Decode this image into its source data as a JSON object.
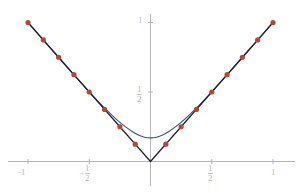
{
  "chart_data": {
    "type": "line",
    "title": "",
    "subtitle": "",
    "xlabel": "",
    "ylabel": "",
    "xlim": [
      -1.12,
      1.12
    ],
    "ylim": [
      -0.22,
      1.12
    ],
    "grid": false,
    "legend": null,
    "xticks": [
      -1,
      -0.5,
      0.5,
      1
    ],
    "xtick_labels": [
      "-1",
      "-1/2",
      "1/2",
      "1"
    ],
    "yticks": [
      0.5,
      1
    ],
    "ytick_labels": [
      "1/2",
      "1"
    ],
    "series": [
      {
        "name": "abs",
        "kind": "line",
        "color": "#1b1b2e",
        "width": 1.3,
        "x": [
          -1,
          -0.875,
          -0.75,
          -0.625,
          -0.5,
          -0.375,
          -0.25,
          -0.125,
          0,
          0.125,
          0.25,
          0.375,
          0.5,
          0.625,
          0.75,
          0.875,
          1
        ],
        "values": [
          1,
          0.875,
          0.75,
          0.625,
          0.5,
          0.375,
          0.25,
          0.125,
          0,
          0.125,
          0.25,
          0.375,
          0.5,
          0.625,
          0.75,
          0.875,
          1
        ]
      },
      {
        "name": "approximation",
        "kind": "line",
        "color": "#3b4f7d",
        "width": 1.1,
        "x": [
          -1,
          -0.9,
          -0.8,
          -0.7,
          -0.6,
          -0.5,
          -0.4,
          -0.3,
          -0.25,
          -0.2,
          -0.15,
          -0.1,
          -0.05,
          0,
          0.05,
          0.1,
          0.15,
          0.2,
          0.25,
          0.3,
          0.4,
          0.5,
          0.6,
          0.7,
          0.8,
          0.9,
          1
        ],
        "values": [
          1.0,
          0.898,
          0.797,
          0.697,
          0.598,
          0.501,
          0.407,
          0.321,
          0.282,
          0.247,
          0.216,
          0.191,
          0.175,
          0.17,
          0.175,
          0.191,
          0.216,
          0.247,
          0.282,
          0.321,
          0.407,
          0.501,
          0.598,
          0.697,
          0.797,
          0.898,
          1.0
        ]
      },
      {
        "name": "nodes",
        "kind": "scatter",
        "color": "#b34733",
        "size": 2.6,
        "x": [
          -1,
          -0.875,
          -0.75,
          -0.625,
          -0.5,
          -0.375,
          -0.25,
          -0.125,
          0.125,
          0.25,
          0.375,
          0.5,
          0.625,
          0.75,
          0.875,
          1
        ],
        "values": [
          1,
          0.875,
          0.75,
          0.625,
          0.5,
          0.375,
          0.25,
          0.125,
          0.125,
          0.25,
          0.375,
          0.5,
          0.625,
          0.75,
          0.875,
          1
        ]
      }
    ]
  },
  "axes": {
    "axis_color": "#b5b5b5",
    "x_tick_labels": {
      "neg_one": "-1",
      "neg_half_num": "1",
      "neg_half_den": "2",
      "neg_half_sign": "−",
      "half_num": "1",
      "half_den": "2",
      "one": "1"
    },
    "y_tick_labels": {
      "one": "1",
      "half_num": "1",
      "half_den": "2"
    }
  },
  "colors": {
    "background": "#ffffff",
    "curve_exact": "#1b1b2e",
    "curve_approx": "#3b4f7d",
    "points": "#b34733",
    "axis": "#b5b5b5",
    "label": "#b9b9b9"
  }
}
